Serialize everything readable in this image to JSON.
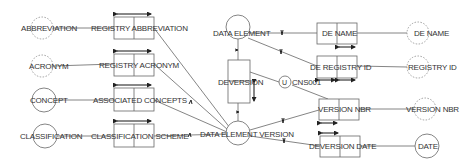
{
  "diagram": {
    "type": "ORM-entity-relationship",
    "colors": {
      "line": "#555555",
      "text": "#333333",
      "background": "#ffffff"
    },
    "value_types": [
      {
        "id": "abbreviation",
        "label": "ABBREVIATION",
        "style": "dashed"
      },
      {
        "id": "acronym",
        "label": "ACRONYM",
        "style": "dashed"
      },
      {
        "id": "de_name_vt",
        "label": "DE NAME",
        "style": "dashed"
      },
      {
        "id": "registry_id_vt",
        "label": "REGISTRY ID",
        "style": "dashed"
      },
      {
        "id": "version_nbr_vt",
        "label": "VERSION NBR",
        "style": "dashed"
      }
    ],
    "entity_types": [
      {
        "id": "concept",
        "label": "CONCEPT"
      },
      {
        "id": "classification",
        "label": "CLASSIFICATION"
      },
      {
        "id": "data_element",
        "label": "DATA ELEMENT"
      },
      {
        "id": "data_element_version",
        "label": "DATA ELEMENT VERSION"
      },
      {
        "id": "date",
        "label": "DATE"
      }
    ],
    "fact_types": [
      {
        "id": "registry_abbreviation",
        "label": "REGISTRY ABBREVIATION"
      },
      {
        "id": "registry_acronym",
        "label": "REGISTRY ACRONYM"
      },
      {
        "id": "associated_concepts",
        "label": "ASSOCIATED CONCEPTS"
      },
      {
        "id": "classification_scheme",
        "label": "CLASSIFICATION SCHEME"
      },
      {
        "id": "deversion",
        "label": "DEVERSION"
      },
      {
        "id": "de_name",
        "label": "DE NAME"
      },
      {
        "id": "de_registry_id",
        "label": "DE REGISTRY ID"
      },
      {
        "id": "version_nbr",
        "label": "VERSION NBR"
      },
      {
        "id": "deversion_date",
        "label": "DEVERSION DATE"
      }
    ],
    "constraints": [
      {
        "id": "cns001",
        "symbol": "U",
        "label": "CNS001"
      }
    ]
  }
}
